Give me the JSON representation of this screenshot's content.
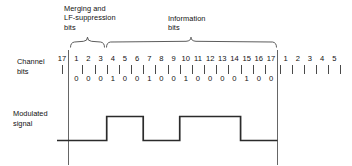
{
  "figure": {
    "groups": [
      {
        "id": "merging",
        "lines": [
          "Merging and",
          "LF-suppression",
          "bits"
        ],
        "bit_from": 1,
        "bit_to": 3
      },
      {
        "id": "information",
        "lines": [
          "Information",
          "bits"
        ],
        "bit_from": 4,
        "bit_to": 17
      }
    ],
    "rows": [
      {
        "id": "channel-bits",
        "lines": [
          "Channel",
          "bits"
        ]
      },
      {
        "id": "modulated-signal",
        "lines": [
          "Modulated",
          "signal"
        ]
      }
    ],
    "lead_in": {
      "label": "17"
    },
    "frame_numbers": [
      "1",
      "2",
      "3",
      "4",
      "5",
      "6",
      "7",
      "8",
      "9",
      "10",
      "11",
      "12",
      "13",
      "14",
      "15",
      "16",
      "17"
    ],
    "trailing_numbers": [
      "1",
      "2",
      "3",
      "4",
      "5"
    ],
    "bit_values": [
      "0",
      "0",
      "0",
      "1",
      "0",
      "0",
      "1",
      "0",
      "0",
      "1",
      "0",
      "0",
      "0",
      "0",
      "1",
      "0",
      "0"
    ],
    "waveform": {
      "description": "NRZI modulated signal, level inverts at every channel bit equal to 1",
      "start_level": "low",
      "transitions_at_bits": [
        4,
        7,
        10,
        15
      ],
      "segments": [
        {
          "from_bit": 1,
          "to_bit": 3,
          "level": "low"
        },
        {
          "from_bit": 4,
          "to_bit": 6,
          "level": "high"
        },
        {
          "from_bit": 7,
          "to_bit": 9,
          "level": "low"
        },
        {
          "from_bit": 10,
          "to_bit": 14,
          "level": "high"
        },
        {
          "from_bit": 15,
          "to_bit": 17,
          "level": "low"
        }
      ]
    },
    "colors": {
      "ink": "#1a1a1a",
      "signal": "#2b2b2b",
      "tick": "#4a4a4a",
      "rule": "#666666",
      "background": "#ffffff"
    }
  }
}
